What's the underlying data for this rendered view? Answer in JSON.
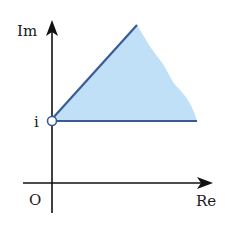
{
  "diagram": {
    "type": "complex-plane-region",
    "axes": {
      "x_label": "Re",
      "y_label": "Im",
      "origin_label": "O"
    },
    "point": {
      "label": "i",
      "style": "open-circle"
    },
    "region": {
      "description": "shaded wedge between ray at 45 degrees and horizontal ray from i",
      "fill_color": "#bfe0f6",
      "boundary_color": "#3a5a9a"
    }
  },
  "colors": {
    "axis": "#111111",
    "fill": "#bfe0f6",
    "boundary": "#3a5a9a"
  }
}
